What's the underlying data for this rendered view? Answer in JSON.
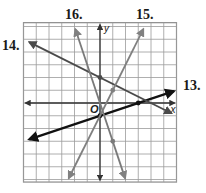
{
  "figure": {
    "grid": {
      "x_min": -6,
      "x_max": 6,
      "y_min": -6.2,
      "y_max": 6.3,
      "cell_px": 12.75,
      "origin_px": [
        100,
        103
      ],
      "line_color": "#9a9a9a",
      "border_color": "#8a8a8a"
    },
    "axes": {
      "x_label": "x",
      "y_label": "y",
      "origin_label": "O",
      "color": "#333333"
    },
    "lines": [
      {
        "label": "13.",
        "equation": "y = (1/3)x - 1",
        "slope": 0.3333,
        "intercept": -1,
        "color": "#111111",
        "width": 2.2,
        "x_from": -5.55,
        "x_to": 5.8,
        "points": [
          [
            0,
            -1
          ],
          [
            3,
            0
          ]
        ],
        "label_px": [
          183,
          90
        ]
      },
      {
        "label": "14.",
        "equation": "y = -(1/2)x + 2",
        "slope": -0.5,
        "intercept": 2,
        "color": "#4a4a4a",
        "width": 1.8,
        "x_from": -5.55,
        "x_to": 5.6,
        "points": [
          [
            0,
            2
          ]
        ],
        "label_px": [
          2,
          50
        ]
      },
      {
        "label": "15.",
        "equation": "y = 2x - 1",
        "slope": 2,
        "intercept": -1,
        "color": "#808080",
        "width": 1.8,
        "x_from": -2.45,
        "x_to": 3.4,
        "points": [
          [
            1,
            1
          ]
        ],
        "label_px": [
          136,
          19
        ]
      },
      {
        "label": "16.",
        "equation": "y = -3x",
        "slope": -3,
        "intercept": 0,
        "color": "#7a7a7a",
        "width": 1.8,
        "x_from": -1.93,
        "x_to": 1.97,
        "points": [
          [
            1,
            -3
          ]
        ],
        "label_px": [
          65,
          19
        ]
      }
    ]
  }
}
